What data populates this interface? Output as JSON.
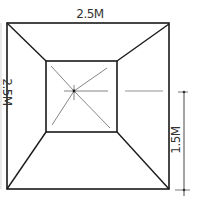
{
  "diagram": {
    "labels": {
      "top_width": "2.5M",
      "left_side": "2.5M",
      "right_height": "1.5M"
    },
    "colors": {
      "stroke": "#1a1a1a",
      "thin_stroke": "#555555",
      "text": "#333333",
      "background": "#ffffff"
    },
    "shapes": {
      "outer_square": {
        "x1": 7,
        "y1": 23,
        "x2": 169,
        "y2": 189
      },
      "inner_square": {
        "x1": 46,
        "y1": 61,
        "x2": 117,
        "y2": 132
      },
      "apex": {
        "x": 74,
        "y": 91
      }
    }
  }
}
